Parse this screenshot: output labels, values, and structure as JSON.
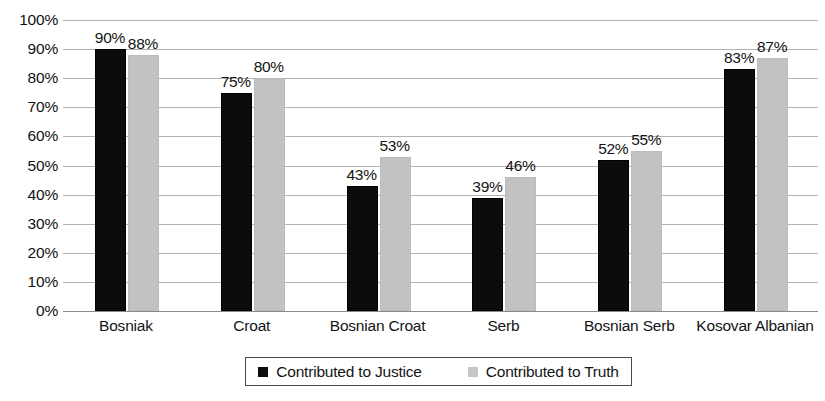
{
  "chart_data": {
    "type": "bar",
    "title": "",
    "subtitle": "",
    "xlabel": "",
    "ylabel": "",
    "ylim": [
      0,
      100
    ],
    "ytick_labels": [
      "100%",
      "90%",
      "80%",
      "70%",
      "60%",
      "50%",
      "40%",
      "30%",
      "20%",
      "10%",
      "0%"
    ],
    "ytick_values": [
      100,
      90,
      80,
      70,
      60,
      50,
      40,
      30,
      20,
      10,
      0
    ],
    "grid": true,
    "legend_position": "bottom",
    "categories": [
      "Bosniak",
      "Croat",
      "Bosnian Croat",
      "Serb",
      "Bosnian Serb",
      "Kosovar Albanian"
    ],
    "series": [
      {
        "name": "Contributed to Justice",
        "color": "#0c0c0c",
        "values": [
          90,
          75,
          43,
          39,
          52,
          83
        ],
        "labels": [
          "90%",
          "75%",
          "43%",
          "39%",
          "52%",
          "83%"
        ]
      },
      {
        "name": "Contributed to Truth",
        "color": "#c2c2c2",
        "values": [
          88,
          80,
          53,
          46,
          55,
          87
        ],
        "labels": [
          "88%",
          "80%",
          "53%",
          "46%",
          "55%",
          "87%"
        ]
      }
    ]
  },
  "legend": {
    "entries": [
      {
        "label": "Contributed to Justice",
        "swatch": "justice-swatch-icon"
      },
      {
        "label": "Contributed to Truth",
        "swatch": "truth-swatch-icon"
      }
    ]
  }
}
